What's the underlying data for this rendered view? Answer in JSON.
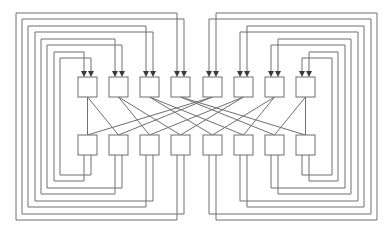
{
  "diagram": {
    "type": "shuffle-exchange network",
    "title": "",
    "node_count_per_stage": 8,
    "colors": {
      "stroke": "#6f6f6f",
      "arrow": "#3a3a3a",
      "background": "#ffffff",
      "box_fill": "#ffffff"
    },
    "top_boxes_x": [
      78,
      109,
      140,
      171,
      203,
      234,
      265,
      296
    ],
    "bottom_boxes_x": [
      78,
      109,
      140,
      171,
      203,
      234,
      265,
      296
    ],
    "box_size": {
      "w": 19,
      "h": 20
    },
    "top_row_y": 77,
    "bottom_row_y": 135,
    "shuffle_edges": [
      [
        0,
        0
      ],
      [
        0,
        1
      ],
      [
        1,
        2
      ],
      [
        1,
        3
      ],
      [
        2,
        4
      ],
      [
        2,
        5
      ],
      [
        3,
        6
      ],
      [
        3,
        7
      ],
      [
        4,
        0
      ],
      [
        4,
        1
      ],
      [
        5,
        2
      ],
      [
        5,
        3
      ],
      [
        6,
        4
      ],
      [
        6,
        5
      ],
      [
        7,
        6
      ],
      [
        7,
        7
      ]
    ],
    "feedback_loops": "each bottom node i has two outputs routed around the outside back to the two inputs of top node i"
  }
}
